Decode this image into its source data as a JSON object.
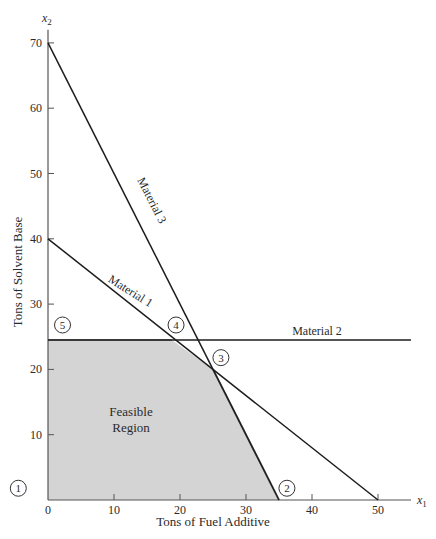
{
  "chart_data": {
    "type": "line",
    "title": "",
    "xlabel": "Tons of Fuel Additive",
    "ylabel": "Tons of Solvent Base",
    "x_axis_symbol": "x",
    "x_axis_subscript": "1",
    "y_axis_symbol": "x",
    "y_axis_subscript": "2",
    "xlim": [
      0,
      55
    ],
    "ylim": [
      0,
      72
    ],
    "x_ticks": [
      0,
      10,
      20,
      30,
      40,
      50
    ],
    "y_ticks": [
      10,
      20,
      30,
      40,
      50,
      60,
      70
    ],
    "grid": false,
    "series": [
      {
        "name": "Material 1",
        "points": [
          [
            0,
            40
          ],
          [
            50,
            0
          ]
        ],
        "label_pos": [
          9,
          33.5
        ],
        "label_angle": 32
      },
      {
        "name": "Material 2",
        "points": [
          [
            0,
            24.5
          ],
          [
            55,
            24.5
          ]
        ],
        "label_pos": [
          37,
          25.3
        ],
        "label_angle": 0
      },
      {
        "name": "Material 3",
        "points": [
          [
            0,
            70
          ],
          [
            35,
            0
          ]
        ],
        "label_pos": [
          13.5,
          49
        ],
        "label_angle": 63
      }
    ],
    "feasible_region": {
      "label_line1": "Feasible",
      "label_line2": "Region",
      "vertices": [
        [
          0,
          0
        ],
        [
          35,
          0
        ],
        [
          25,
          20
        ],
        [
          18.75,
          24.5
        ],
        [
          0,
          24.5
        ]
      ],
      "fill": "#d4d4d4",
      "edge": "#8c8c8c"
    },
    "extreme_points": [
      {
        "label": "1",
        "x": 0,
        "y": 0,
        "label_x": -4.5,
        "label_y": 1.8
      },
      {
        "label": "2",
        "x": 35,
        "y": 0,
        "label_x": 36.2,
        "label_y": 1.8
      },
      {
        "label": "3",
        "x": 25,
        "y": 20,
        "label_x": 26.2,
        "label_y": 21.8
      },
      {
        "label": "4",
        "x": 18.75,
        "y": 24.5,
        "label_x": 19.4,
        "label_y": 26.8
      },
      {
        "label": "5",
        "x": 0,
        "y": 24.5,
        "label_x": 2.2,
        "label_y": 26.8
      }
    ]
  }
}
